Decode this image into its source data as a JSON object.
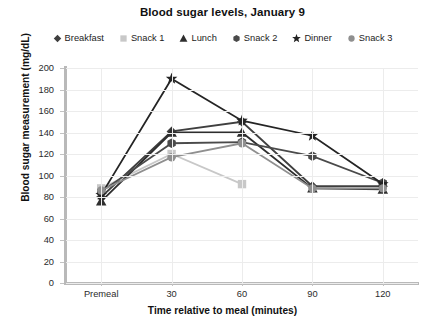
{
  "chart_data": {
    "type": "line",
    "title": "Blood sugar levels, January 9",
    "xlabel": "Time relative to meal (minutes)",
    "ylabel": "Blood sugar measurement (mg/dL)",
    "categories": [
      "Premeal",
      "30",
      "60",
      "90",
      "120"
    ],
    "xtick_labels": [
      "Premeal",
      "30",
      "60",
      "90",
      "120"
    ],
    "ytick_labels": [
      "0",
      "20",
      "40",
      "60",
      "80",
      "100",
      "120",
      "140",
      "160",
      "180",
      "200"
    ],
    "ylim": [
      0,
      200
    ],
    "ytick_step": 20,
    "grid": true,
    "legend_position": "top",
    "series": [
      {
        "name": "Breakfast",
        "marker": "diamond",
        "color": "#3f3f3f",
        "values": [
          80,
          141,
          150,
          90,
          90
        ]
      },
      {
        "name": "Snack 1",
        "marker": "square",
        "color": "#c8c8c8",
        "values": [
          88,
          120,
          92,
          null,
          null
        ]
      },
      {
        "name": "Lunch",
        "marker": "triangle",
        "color": "#2e2e2e",
        "values": [
          76,
          140,
          140,
          88,
          87
        ]
      },
      {
        "name": "Snack 2",
        "marker": "hexagon",
        "color": "#4a4a4a",
        "values": [
          85,
          130,
          131,
          118,
          93
        ]
      },
      {
        "name": "Dinner",
        "marker": "star",
        "color": "#242424",
        "values": [
          82,
          190,
          151,
          137,
          92
        ]
      },
      {
        "name": "Snack 3",
        "marker": "circle",
        "color": "#8f8f8f",
        "values": [
          86,
          117,
          130,
          88,
          88
        ]
      }
    ]
  },
  "legend": {
    "items": [
      {
        "label": "Breakfast"
      },
      {
        "label": "Snack 1"
      },
      {
        "label": "Lunch"
      },
      {
        "label": "Snack 2"
      },
      {
        "label": "Dinner"
      },
      {
        "label": "Snack 3"
      }
    ]
  }
}
